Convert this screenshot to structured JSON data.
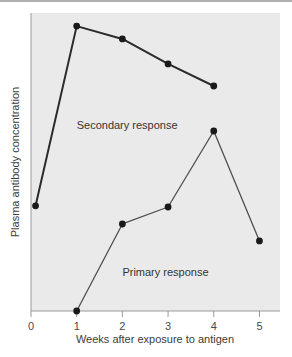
{
  "chart_data": {
    "type": "line",
    "title": "",
    "xlabel": "Weeks after exposure to antigen",
    "ylabel": "Plasma antibody concentration",
    "xticks": [
      "0",
      "1",
      "2",
      "3",
      "4",
      "5"
    ],
    "xlim": [
      0,
      5.45
    ],
    "ylim": [
      0,
      100
    ],
    "yticks": [],
    "grid": false,
    "legend_position": "inline-annotation",
    "background_color": "#eaeaea",
    "page_background_color": "#ffffff",
    "axis_color": "#9a9a9a",
    "series": [
      {
        "name": "Secondary response",
        "color": "#2b2b2b",
        "line_width": 2.0,
        "marker": "filled-circle",
        "x": [
          0.1,
          1,
          2,
          3,
          4
        ],
        "y": [
          35.3,
          95.6,
          91.3,
          82.9,
          75.5
        ]
      },
      {
        "name": "Primary response",
        "color": "#4f4f4f",
        "line_width": 1.3,
        "marker": "filled-circle",
        "x": [
          1,
          2,
          3,
          4,
          5
        ],
        "y": [
          0,
          29.2,
          34.9,
          60.4,
          23.5
        ]
      }
    ],
    "annotations": [
      {
        "text": "Secondary response",
        "x": 1.0,
        "y": 61.0
      },
      {
        "text": "Primary response",
        "x": 2.0,
        "y": 11.8
      }
    ]
  }
}
